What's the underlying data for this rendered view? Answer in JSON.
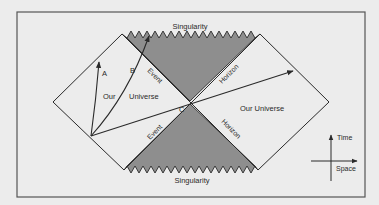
{
  "diagram": {
    "type": "penrose-diagram",
    "colors": {
      "background": "#ececec",
      "frame": "#555555",
      "line": "#2a2a2a",
      "shaded_region": "#8e8e8e",
      "text": "#2a2a2a"
    },
    "labels": {
      "singularity_top": "Singularity",
      "singularity_bottom": "Singularity",
      "event_upper": "Event",
      "event_lower": "Event",
      "horizon_upper": "Horizon",
      "horizon_lower": "Horizon",
      "our": "Our",
      "universe": "Universe",
      "our_universe_right": "Our Universe",
      "path_a": "A",
      "path_b": "B",
      "path_c": "C"
    },
    "axes": {
      "vertical_label": "Time",
      "horizontal_label": "Space"
    },
    "regions": [
      {
        "name": "left-universe",
        "shaded": false
      },
      {
        "name": "right-universe",
        "shaded": false
      },
      {
        "name": "black-hole-interior",
        "shaded": true
      },
      {
        "name": "white-hole-interior",
        "shaded": true
      }
    ],
    "worldlines": [
      {
        "name": "A",
        "ends_in": "left-universe"
      },
      {
        "name": "B",
        "ends_in": "singularity"
      },
      {
        "name": "C",
        "ends_in": "right-universe"
      }
    ]
  }
}
